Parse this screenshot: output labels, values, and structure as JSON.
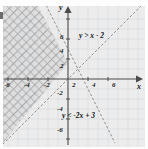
{
  "figure": {
    "type": "system-of-linear-inequalities-graph",
    "axes": {
      "x_label": "x",
      "y_label": "y",
      "x_ticks": [
        "-6",
        "-4",
        "-2",
        "2",
        "4",
        "6"
      ],
      "y_ticks": [
        "6",
        "4",
        "2",
        "-2",
        "-4",
        "-6"
      ],
      "x_range": [
        -7.2,
        7.4
      ],
      "y_range": [
        -7.2,
        7.6
      ],
      "grid": true,
      "grid_step": 1,
      "tick_step": 2
    },
    "inequalities": [
      {
        "label": "y > x - 2",
        "slope": 1,
        "intercept": -2,
        "boundary": "dashed",
        "shade": "above"
      },
      {
        "label": "y < -2x + 3",
        "slope": -2,
        "intercept": 3,
        "boundary": "dashed",
        "shade": "below"
      }
    ],
    "colors": {
      "grid": "#cfd6dc",
      "axis": "#4a4a4a",
      "boundary": "#8a8a8a",
      "shade_light": "#e3e3e3",
      "shade_overlap": "#bdbdbd",
      "text": "#1b1b1b"
    }
  }
}
